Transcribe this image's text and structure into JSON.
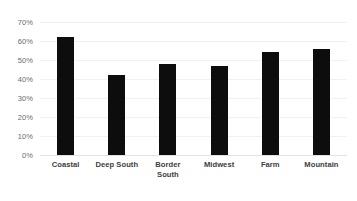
{
  "chart_data": {
    "type": "bar",
    "title": "",
    "subtitle": "",
    "xlabel": "",
    "ylabel": "",
    "categories": [
      "Coastal",
      "Deep South",
      "Border South",
      "Midwest",
      "Farm",
      "Mountain"
    ],
    "category_lines": [
      [
        "Coastal"
      ],
      [
        "Deep South"
      ],
      [
        "Border",
        "South"
      ],
      [
        "Midwest"
      ],
      [
        "Farm"
      ],
      [
        "Mountain"
      ]
    ],
    "values": [
      62,
      42,
      48,
      47,
      54,
      56
    ],
    "value_labels": [
      "62%",
      "42%",
      "48%",
      "47%",
      "54%",
      "56%"
    ],
    "ylim": [
      0,
      70
    ],
    "ytick_values": [
      0,
      10,
      20,
      30,
      40,
      50,
      60,
      70
    ],
    "ytick_labels": [
      "0%",
      "10%",
      "20%",
      "30%",
      "40%",
      "50%",
      "60%",
      "70%"
    ],
    "grid": true,
    "grid_axis": "y",
    "legend": false,
    "legend_position": "none",
    "bar_color": "#0d0d0d",
    "gridline_color": "#f1f1f1",
    "axis_color": "#e2e2e2",
    "tick_label_color": "#6b6b6b",
    "category_label_color": "#404040",
    "background_color": "#ffffff"
  }
}
